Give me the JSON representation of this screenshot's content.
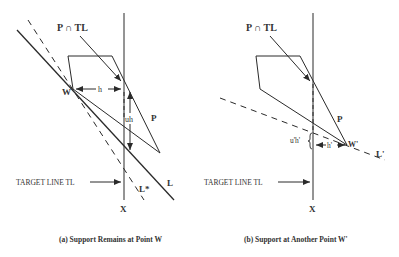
{
  "panels": [
    {
      "id": "a",
      "caption": "(a) Support  Remains at Point W",
      "labels": {
        "intersection": "P ∩ TL",
        "point_w": "W",
        "h": "h",
        "uh": "uh",
        "polygon": "P",
        "line_l": "L",
        "line_lstar": "L*",
        "target_line": "TARGET LINE TL",
        "x": "X"
      }
    },
    {
      "id": "b",
      "caption": "(b) Support at Another Point W'",
      "labels": {
        "intersection": "P ∩ TL",
        "point_w": "W'",
        "h": "h'",
        "uh": "u'h'",
        "polygon": "P",
        "line_l": "L'",
        "target_line": "TARGET LINE TL",
        "x": "X"
      }
    }
  ],
  "colors": {
    "stroke": "#2a2a2a",
    "text": "#333333"
  }
}
